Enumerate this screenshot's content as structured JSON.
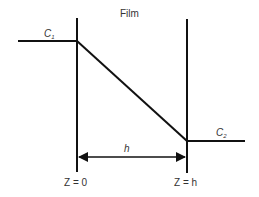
{
  "diagram": {
    "title": "Film",
    "left_concentration": {
      "symbol": "C",
      "subscript": "1"
    },
    "right_concentration": {
      "symbol": "C",
      "subscript": "2"
    },
    "thickness_label": "h",
    "left_boundary_label": "Z = 0",
    "right_boundary_label": "Z = h",
    "colors": {
      "line": "#111111",
      "text": "#333333",
      "background": "#ffffff"
    }
  }
}
